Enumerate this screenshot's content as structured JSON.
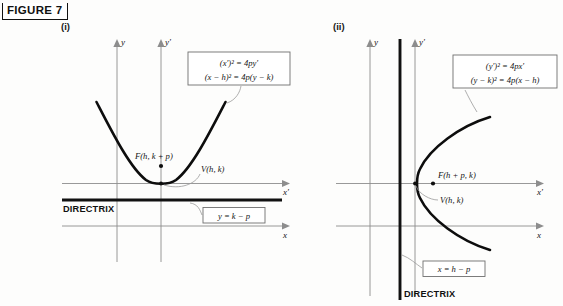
{
  "figure": {
    "label": "FIGURE 7"
  },
  "panels": [
    {
      "id": "panel-i",
      "caption": "(i)",
      "orientation": "vertical-parabola-opening-up",
      "axes": {
        "y_label": "y",
        "yprime_label": "y′",
        "x_label": "x",
        "xprime_label": "x′"
      },
      "equation_box": {
        "line1": "(x′)² = 4py′",
        "line2": "(x − h)² = 4p(y − k)"
      },
      "focus_label": "F(h, k + p)",
      "vertex_label": "V(h, k)",
      "directrix_label": "DIRECTRIX",
      "directrix_equation": "y = k − p"
    },
    {
      "id": "panel-ii",
      "caption": "(ii)",
      "orientation": "horizontal-parabola-opening-right",
      "axes": {
        "y_label": "y",
        "yprime_label": "y′",
        "x_label": "x",
        "xprime_label": "x′"
      },
      "equation_box": {
        "line1": "(y′)² = 4px′",
        "line2": "(y − k)² = 4p(x − h)"
      },
      "focus_label": "F(h + p, k)",
      "vertex_label": "V(h, k)",
      "directrix_label": "DIRECTRIX",
      "directrix_equation": "x = h − p"
    }
  ],
  "colors": {
    "curve": "#0d0d0d",
    "axis": "#8d8d8d",
    "directrix": "#111111",
    "leader": "#9a9a9a",
    "box_border": "#6f6f6f",
    "background": "#fdfdfc"
  }
}
